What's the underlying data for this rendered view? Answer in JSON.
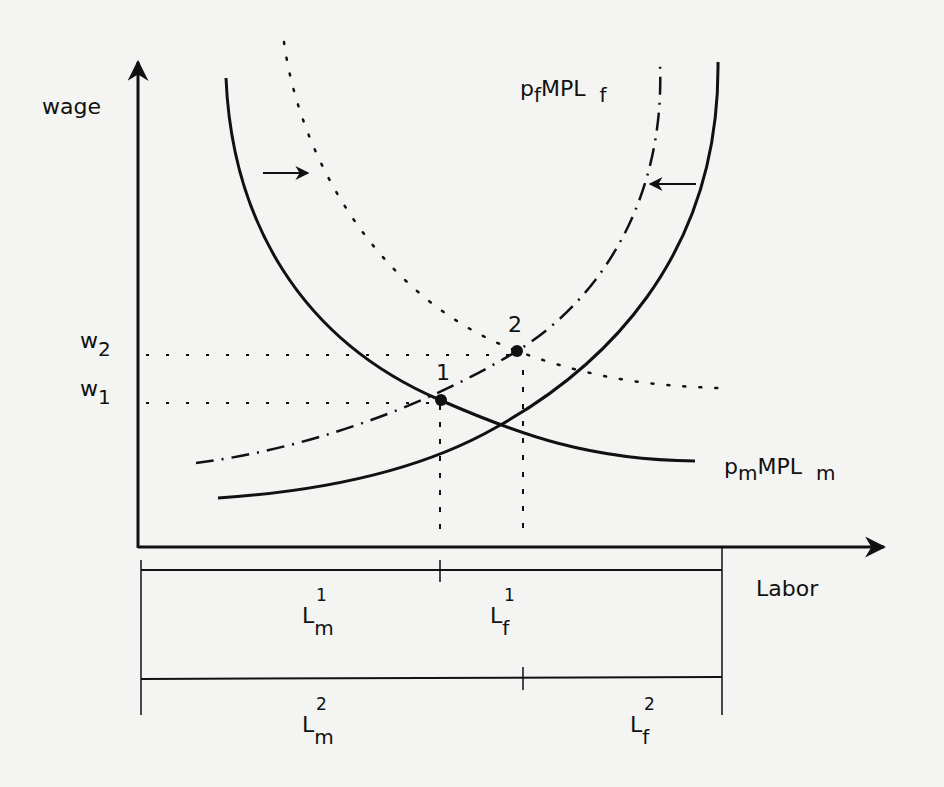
{
  "diagram": {
    "type": "labor-allocation-mpl",
    "axes": {
      "y_label": "wage",
      "x_label": "Labor"
    },
    "wage_levels": [
      {
        "base": "w",
        "sub": "2"
      },
      {
        "base": "w",
        "sub": "1"
      }
    ],
    "curves": [
      {
        "name": "pmMPLm",
        "label_p": "p",
        "label_p_sub": "m",
        "label_mpl": "MPL",
        "label_mpl_sub": "m",
        "style": "solid"
      },
      {
        "name": "pfMPLf",
        "label_p": "p",
        "label_p_sub": "f",
        "label_mpl": "MPL",
        "label_mpl_sub": "f",
        "style": "solid"
      },
      {
        "name": "pm-shifted",
        "style": "dotted"
      },
      {
        "name": "pf-shifted",
        "style": "dash-dot"
      }
    ],
    "points": [
      {
        "label": "1"
      },
      {
        "label": "2"
      }
    ],
    "allocation_bars": [
      {
        "left": {
          "base": "L",
          "sub": "m",
          "sup": "1"
        },
        "right": {
          "base": "L",
          "sub": "f",
          "sup": "1"
        }
      },
      {
        "left": {
          "base": "L",
          "sub": "m",
          "sup": "2"
        },
        "right": {
          "base": "L",
          "sub": "f",
          "sup": "2"
        }
      }
    ],
    "shift_arrows": [
      "right",
      "left"
    ],
    "colors": {
      "ink": "#111111",
      "paper": "#f4f4f2"
    }
  }
}
